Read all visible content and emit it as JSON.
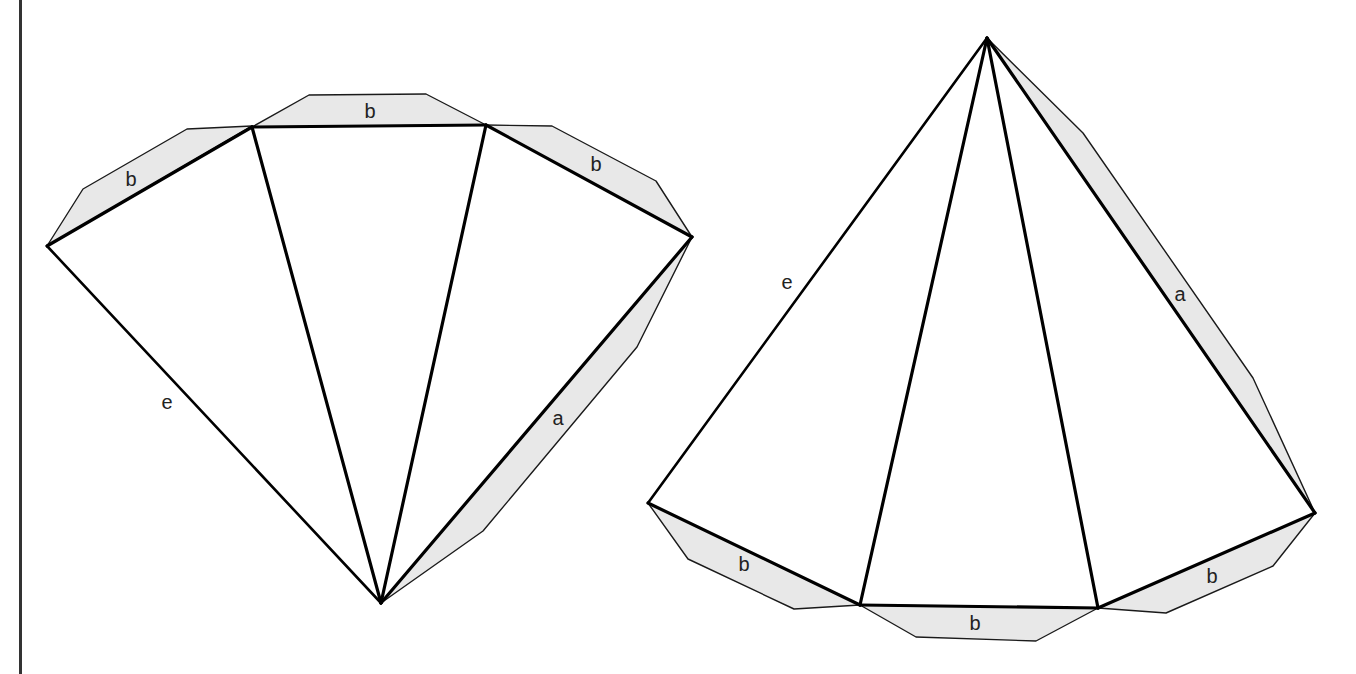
{
  "diagram": {
    "type": "pyramid-nets",
    "colors": {
      "background": "#ffffff",
      "line": "#000000",
      "flap_fill": "#e8e8e8",
      "border": "#333333",
      "label": "#222222"
    },
    "left_net": {
      "labels": {
        "flap_left": "b",
        "flap_top": "b",
        "flap_right": "b",
        "flap_side": "a",
        "edge_e": "e"
      }
    },
    "right_net": {
      "labels": {
        "flap_side": "a",
        "flap_bottom_left": "b",
        "flap_bottom_mid": "b",
        "flap_bottom_right": "b",
        "edge_e": "e"
      }
    }
  }
}
